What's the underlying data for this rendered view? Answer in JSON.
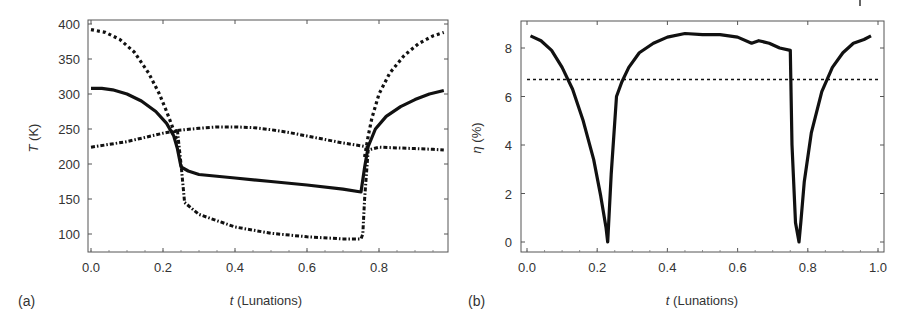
{
  "chart_data": [
    {
      "panel": "(a)",
      "type": "line",
      "title": "",
      "xlabel_italic": "t",
      "xlabel": " (Lunations)",
      "ylabel_italic": "T",
      "ylabel": " (K)",
      "xlim": [
        0.0,
        0.99
      ],
      "ylim": [
        72,
        405
      ],
      "xticks": [
        "0.0",
        "0.2",
        "0.4",
        "0.6",
        "0.8"
      ],
      "xtick_values": [
        0.0,
        0.2,
        0.4,
        0.6,
        0.8
      ],
      "yticks": [
        "100",
        "150",
        "200",
        "250",
        "300",
        "350",
        "400"
      ],
      "ytick_values": [
        100,
        150,
        200,
        250,
        300,
        350,
        400
      ],
      "grid": false,
      "legend": null,
      "series": [
        {
          "name": "solid",
          "style": "solid",
          "x": [
            0.0,
            0.03,
            0.06,
            0.1,
            0.14,
            0.18,
            0.21,
            0.23,
            0.24,
            0.25,
            0.27,
            0.3,
            0.4,
            0.5,
            0.6,
            0.7,
            0.75,
            0.76,
            0.77,
            0.79,
            0.82,
            0.86,
            0.9,
            0.94,
            0.98
          ],
          "y": [
            308,
            308,
            306,
            300,
            290,
            275,
            258,
            240,
            222,
            196,
            190,
            185,
            180,
            175,
            170,
            164,
            160,
            195,
            225,
            250,
            268,
            282,
            292,
            300,
            305
          ]
        },
        {
          "name": "dotted",
          "style": "dotted",
          "x": [
            0.0,
            0.04,
            0.08,
            0.12,
            0.16,
            0.19,
            0.21,
            0.23,
            0.24,
            0.76,
            0.77,
            0.78,
            0.8,
            0.83,
            0.87,
            0.91,
            0.95,
            0.98
          ],
          "y": [
            392,
            388,
            378,
            360,
            330,
            300,
            275,
            248,
            230,
            210,
            240,
            265,
            300,
            330,
            355,
            372,
            383,
            388
          ],
          "gap_after_index": 8
        },
        {
          "name": "dash-dot",
          "style": "dashdot",
          "x": [
            0.0,
            0.05,
            0.1,
            0.15,
            0.2,
            0.24,
            0.25,
            0.26,
            0.3,
            0.4,
            0.5,
            0.6,
            0.7,
            0.75,
            0.755,
            0.76,
            0.77,
            0.8,
            0.85,
            0.9,
            0.95,
            0.98
          ],
          "y": [
            224,
            228,
            232,
            238,
            244,
            248,
            200,
            145,
            128,
            110,
            101,
            96,
            93,
            93,
            100,
            150,
            220,
            224,
            223,
            222,
            221,
            220
          ],
          "upper_branch": {
            "x": [
              0.24,
              0.3,
              0.35,
              0.4,
              0.45,
              0.5,
              0.55,
              0.6,
              0.65,
              0.7,
              0.75,
              0.77
            ],
            "y": [
              248,
              251,
              253,
              253,
              252,
              249,
              245,
              240,
              235,
              230,
              226,
              224
            ]
          }
        }
      ]
    },
    {
      "panel": "(b)",
      "type": "line",
      "title": "",
      "xlabel_italic": "t",
      "xlabel": " (Lunations)",
      "ylabel_italic": "η",
      "ylabel": " (%)",
      "xlim": [
        -0.02,
        1.0
      ],
      "ylim": [
        -0.4,
        9.1
      ],
      "xticks": [
        "0.0",
        "0.2",
        "0.4",
        "0.6",
        "0.8",
        "1.0"
      ],
      "xtick_values": [
        0.0,
        0.2,
        0.4,
        0.6,
        0.8,
        1.0
      ],
      "yticks": [
        "0",
        "2",
        "4",
        "6",
        "8"
      ],
      "ytick_values": [
        0,
        2,
        4,
        6,
        8
      ],
      "grid": false,
      "legend": null,
      "series": [
        {
          "name": "eta",
          "style": "solid",
          "x": [
            0.01,
            0.04,
            0.07,
            0.1,
            0.13,
            0.16,
            0.19,
            0.21,
            0.225,
            0.23,
            0.24,
            0.255,
            0.27,
            0.29,
            0.32,
            0.36,
            0.4,
            0.45,
            0.5,
            0.55,
            0.6,
            0.64,
            0.66,
            0.69,
            0.72,
            0.75,
            0.755,
            0.765,
            0.775,
            0.78,
            0.79,
            0.81,
            0.84,
            0.87,
            0.9,
            0.93,
            0.96,
            0.98
          ],
          "y": [
            8.5,
            8.3,
            7.9,
            7.2,
            6.3,
            5.0,
            3.4,
            1.9,
            0.6,
            0.0,
            2.8,
            6.0,
            6.6,
            7.2,
            7.8,
            8.2,
            8.45,
            8.6,
            8.55,
            8.55,
            8.45,
            8.2,
            8.3,
            8.2,
            8.0,
            7.9,
            4.0,
            0.8,
            0.0,
            0.8,
            2.5,
            4.5,
            6.2,
            7.2,
            7.8,
            8.2,
            8.35,
            8.5
          ]
        },
        {
          "name": "threshold",
          "style": "dotted",
          "x": [
            0.0,
            1.0
          ],
          "y": [
            6.7,
            6.7
          ]
        }
      ]
    }
  ],
  "panels": {
    "a": {
      "label": "(a)",
      "xlabel_t": "t",
      "xlabel_rest": " (Lunations)",
      "ylabel_t": "T",
      "ylabel_rest": " (K)"
    },
    "b": {
      "label": "(b)",
      "xlabel_t": "t",
      "xlabel_rest": " (Lunations)",
      "ylabel_t": "η",
      "ylabel_rest": " (%)"
    }
  }
}
